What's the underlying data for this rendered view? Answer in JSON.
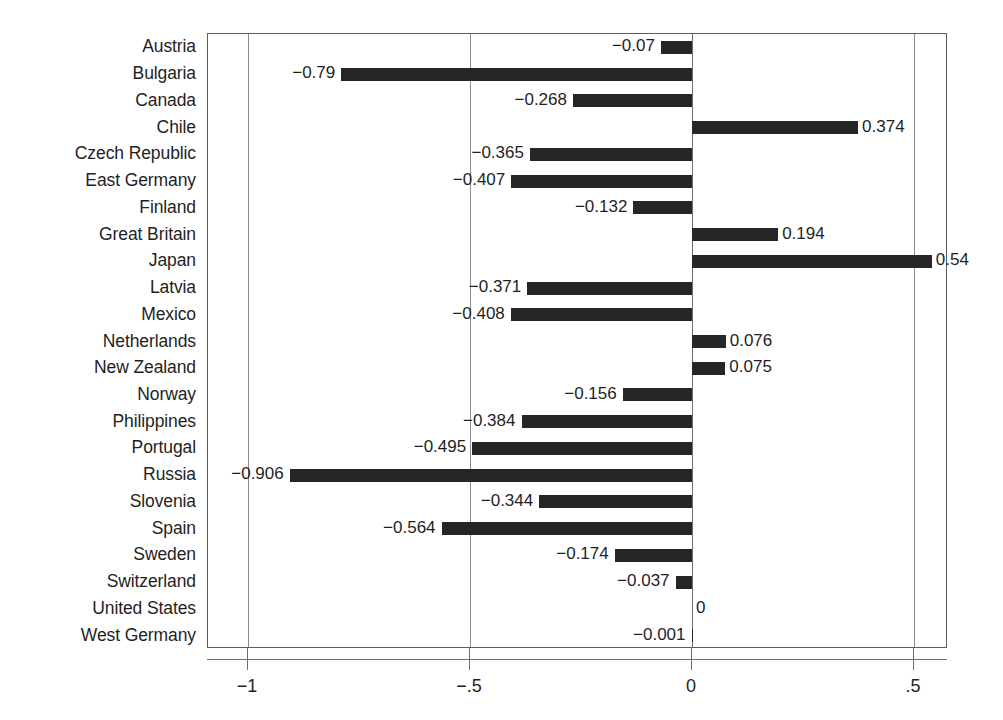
{
  "chart_data": {
    "type": "bar",
    "orientation": "horizontal",
    "title": "",
    "subtitle": "",
    "xlabel": "",
    "ylabel": "",
    "xlim": [
      -1.095,
      0.595
    ],
    "ylim": null,
    "grid": true,
    "grid_axis": "x",
    "legend": null,
    "legend_position": "none",
    "bar_color": "#262626",
    "axis_color": "#6d6d6d",
    "gridline_color": "#8c8c8c",
    "xticks": [
      -1,
      -0.5,
      0,
      0.5
    ],
    "xtick_labels": [
      "-1",
      "-.5",
      "0",
      ".5"
    ],
    "categories": [
      "Austria",
      "Bulgaria",
      "Canada",
      "Chile",
      "Czech Republic",
      "East Germany",
      "Finland",
      "Great Britain",
      "Japan",
      "Latvia",
      "Mexico",
      "Netherlands",
      "New Zealand",
      "Norway",
      "Philippines",
      "Portugal",
      "Russia",
      "Slovenia",
      "Spain",
      "Sweden",
      "Switzerland",
      "United States",
      "West Germany"
    ],
    "values": [
      -0.07,
      -0.79,
      -0.268,
      0.374,
      -0.365,
      -0.407,
      -0.132,
      0.194,
      0.54,
      -0.371,
      -0.408,
      0.076,
      0.075,
      -0.156,
      -0.384,
      -0.495,
      -0.906,
      -0.344,
      -0.564,
      -0.174,
      -0.037,
      0,
      -0.001
    ],
    "value_labels": [
      "−0.07",
      "−0.79",
      "−0.268",
      "0.374",
      "−0.365",
      "−0.407",
      "−0.132",
      "0.194",
      "0.54",
      "−0.371",
      "−0.408",
      "0.076",
      "0.075",
      "−0.156",
      "−0.384",
      "−0.495",
      "−0.906",
      "−0.344",
      "−0.564",
      "−0.174",
      "−0.037",
      "0",
      "−0.001"
    ]
  }
}
